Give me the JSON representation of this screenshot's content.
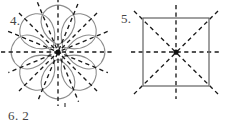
{
  "page": {
    "background_color": "#ffffff",
    "width": 229,
    "height": 127
  },
  "style": {
    "outline_color": "#8c8c8c",
    "square_outline_color": "#6e6e6e",
    "symmetry_line_color": "#1a1a1a",
    "label_color": "#454545",
    "center_dot_color": "#111111"
  },
  "figures": [
    {
      "number_label": "4.",
      "shape_name": "eight-petal-flower",
      "shape_description": "Flower rosette with eight rounded petals arranged radially about a common centre",
      "petal_count": 8,
      "lines_of_symmetry": 8,
      "center": {
        "x": 58,
        "y": 52
      },
      "petal_outer_radius": 46,
      "petal_inner_radius": 9,
      "symmetry_line_angles_deg": [
        0,
        45,
        90,
        135,
        180,
        225,
        270,
        315
      ],
      "symmetry_line_style": "dashed",
      "symmetry_line_extent": 56
    },
    {
      "number_label": "5.",
      "shape_name": "square",
      "shape_description": "Square with its four lines of symmetry drawn as dashed lines",
      "lines_of_symmetry": 4,
      "center": {
        "x": 63,
        "y": 52
      },
      "square_left": 31,
      "square_top": 18,
      "square_size": 66,
      "symmetry_line_angles_deg": [
        0,
        45,
        90,
        135
      ],
      "symmetry_line_style": "dashed",
      "symmetry_line_overhang": 12
    }
  ],
  "answer": {
    "item_number": "6.",
    "value": "2",
    "text": "6. 2"
  }
}
